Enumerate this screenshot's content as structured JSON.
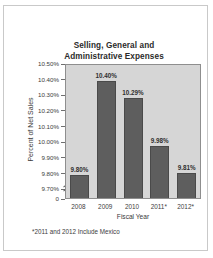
{
  "figure": {
    "title_line1": "Selling, General and",
    "title_line2": "Administrative Expenses",
    "footnote": "*2011 and 2012 Include Mexico",
    "colors": {
      "plot_background": "#d6d6d6",
      "bar_fill": "#5e5e5e",
      "bar_edge": "#4a4a4a",
      "axis": "#8e8e8e",
      "text": "#2f2f2f",
      "frame_border": "#c9c9c9",
      "page_background": "#ffffff"
    }
  },
  "chart_data": {
    "type": "bar",
    "title": "Selling, General and Administrative Expenses",
    "subtitle": "",
    "xlabel": "Fiscal Year",
    "ylabel": "Percent of Net Sales",
    "categories": [
      "2008",
      "2009",
      "2010",
      "2011*",
      "2012*"
    ],
    "values": [
      9.8,
      10.4,
      10.29,
      9.98,
      9.81
    ],
    "value_labels": [
      "9.80%",
      "10.40%",
      "10.29%",
      "9.98%",
      "9.81%"
    ],
    "ylim": [
      9.65,
      10.5
    ],
    "y_axis_break": true,
    "y_axis_break_note": "axis broken between 0 and 9.70%",
    "yticks": [
      10.5,
      10.4,
      10.3,
      10.2,
      10.1,
      10.0,
      9.9,
      9.8,
      9.7,
      0
    ],
    "ytick_labels": [
      "10.50%",
      "10.40%",
      "10.30%",
      "10.20%",
      "10.10%",
      "10.00%",
      "9.90%",
      "9.80%",
      "9.70%",
      "0"
    ],
    "grid": false,
    "legend": false,
    "legend_position": "none",
    "annotations": [
      "*2011 and 2012 Include Mexico"
    ]
  }
}
